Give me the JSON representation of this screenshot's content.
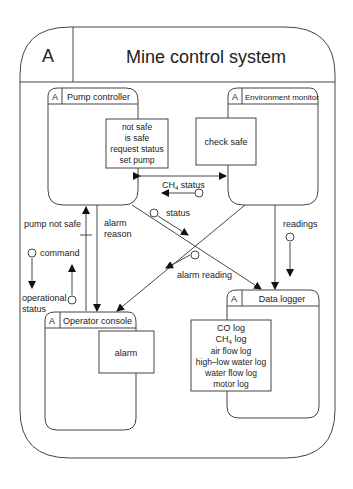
{
  "system": {
    "tag": "A",
    "title": "Mine control system"
  },
  "components": {
    "pump_controller": {
      "tag": "A",
      "title": "Pump controller",
      "interface": [
        "not safe",
        "is safe",
        "request status",
        "set pump"
      ]
    },
    "environment_monitor": {
      "tag": "A",
      "title": "Environment monitor",
      "interface": [
        "check safe"
      ]
    },
    "operator_console": {
      "tag": "A",
      "title": "Operator console",
      "interface": [
        "alarm"
      ]
    },
    "data_logger": {
      "tag": "A",
      "title": "Data logger",
      "interface": [
        "CO log",
        "CH4 log",
        "air flow log",
        "high–low water log",
        "water flow log",
        "motor log"
      ]
    }
  },
  "connections": {
    "ch4_status": {
      "label": "CH",
      "sub": "4",
      "label_rest": " status"
    },
    "status": "status",
    "alarm_reading": "alarm reading",
    "alarm_reason_1": "alarm",
    "alarm_reason_2": "reason",
    "pump_not_safe": "pump not safe",
    "command": "command",
    "operational_1": "operational",
    "operational_2": "status",
    "readings": "readings"
  },
  "log_ch4": {
    "pre": "CH",
    "sub": "4",
    "post": " log"
  }
}
